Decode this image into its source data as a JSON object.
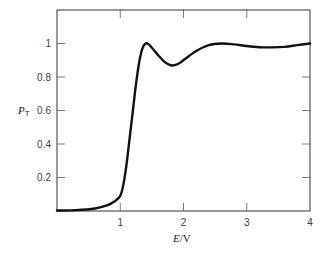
{
  "chart_data": {
    "type": "line",
    "title": "",
    "xlabel": "E/V",
    "ylabel": "P_T",
    "xlabel_parts": {
      "symbol": "E",
      "unit": "/V"
    },
    "ylabel_parts": {
      "symbol": "P",
      "subscript": "T"
    },
    "xlim": [
      0,
      4
    ],
    "ylim": [
      0,
      1.2
    ],
    "x_ticks": [
      1,
      2,
      3,
      4
    ],
    "x_tick_labels": [
      "1",
      "2",
      "3",
      "4"
    ],
    "x_ticks_top": [
      1,
      2,
      3
    ],
    "y_ticks": [
      0.2,
      0.4,
      0.6,
      0.8,
      1.0
    ],
    "y_tick_labels": [
      "0.2",
      "0.4",
      "0.6",
      "0.8",
      "1"
    ],
    "grid": false,
    "legend": null,
    "series": [
      {
        "name": "P_T",
        "color": "#111111",
        "x": [
          0.0,
          0.3,
          0.6,
          0.8,
          0.9,
          1.0,
          1.05,
          1.1,
          1.15,
          1.2,
          1.25,
          1.3,
          1.35,
          1.4,
          1.45,
          1.5,
          1.6,
          1.7,
          1.8,
          1.9,
          2.0,
          2.2,
          2.4,
          2.6,
          2.8,
          3.0,
          3.2,
          3.4,
          3.6,
          3.8,
          4.0
        ],
        "y": [
          0.003,
          0.005,
          0.015,
          0.035,
          0.055,
          0.09,
          0.16,
          0.28,
          0.44,
          0.6,
          0.76,
          0.89,
          0.97,
          1.0,
          0.995,
          0.975,
          0.93,
          0.89,
          0.87,
          0.875,
          0.9,
          0.955,
          0.99,
          1.0,
          0.995,
          0.985,
          0.978,
          0.977,
          0.98,
          0.99,
          1.0
        ]
      }
    ]
  }
}
